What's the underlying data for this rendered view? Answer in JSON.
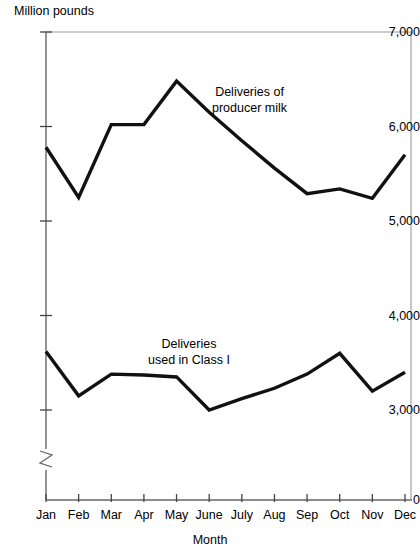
{
  "chart_data": {
    "type": "line",
    "title": "",
    "ylabel": "Million pounds",
    "xlabel": "Month",
    "categories": [
      "Jan",
      "Feb",
      "Mar",
      "Apr",
      "May",
      "June",
      "July",
      "Aug",
      "Sep",
      "Oct",
      "Nov",
      "Dec"
    ],
    "ylim": [
      3000,
      7000
    ],
    "y_axis_break": true,
    "y_axis_break_low_label": "0",
    "yticks": [
      3000,
      4000,
      5000,
      6000,
      7000
    ],
    "ytick_labels": [
      "3,000",
      "4,000",
      "5,000",
      "6,000",
      "7,000"
    ],
    "grid": false,
    "legend_position": "inline-annotation",
    "series": [
      {
        "name": "Deliveries of producer milk",
        "annotation_line1": "Deliveries of",
        "annotation_line2": "producer milk",
        "values": [
          5780,
          5250,
          6020,
          6020,
          6480,
          6150,
          5850,
          5560,
          5290,
          5340,
          5240,
          5700
        ]
      },
      {
        "name": "Deliveries used in Class I",
        "annotation_line1": "Deliveries",
        "annotation_line2": "used in Class I",
        "values": [
          3620,
          3150,
          3380,
          3370,
          3350,
          3000,
          3120,
          3230,
          3380,
          3600,
          3200,
          3400
        ]
      }
    ],
    "colors": {
      "line": "#111111",
      "axis": "#555555",
      "background": "#ffffff"
    }
  }
}
